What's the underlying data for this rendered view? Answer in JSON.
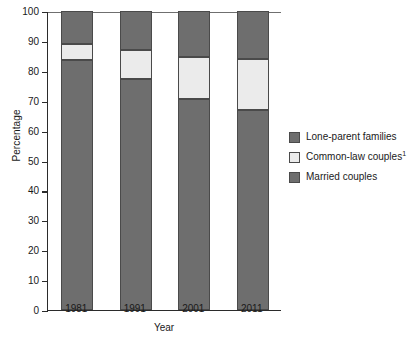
{
  "chart_data": {
    "type": "bar",
    "subtype": "stacked-100-percent",
    "title": "",
    "xlabel": "Year",
    "ylabel": "Percentage",
    "categories": [
      "1981",
      "1991",
      "2001",
      "2011"
    ],
    "ylim": [
      0,
      100
    ],
    "yticks": [
      0,
      10,
      20,
      30,
      40,
      50,
      60,
      70,
      80,
      90,
      100
    ],
    "ytick_labels": [
      "0",
      "10",
      "20",
      "30",
      "40",
      "50",
      "60",
      "70",
      "80",
      "90",
      "100"
    ],
    "grid": false,
    "legend_position": "right",
    "series": [
      {
        "name": "Lone-parent families",
        "color": "#6e6e6e",
        "values": [
          11.0,
          13.0,
          15.5,
          16.0
        ]
      },
      {
        "name": "Common-law couples",
        "footnote": "1",
        "color": "#ebebeb",
        "values": [
          5.5,
          9.8,
          14.0,
          17.0
        ]
      },
      {
        "name": "Married couples",
        "color": "#6e6e6e",
        "values": [
          83.5,
          77.2,
          70.5,
          67.0
        ]
      }
    ],
    "cumulative_tops": {
      "married": [
        83.5,
        77.2,
        70.5,
        67.0
      ],
      "common_law": [
        89.0,
        87.0,
        84.5,
        84.0
      ],
      "lone_parent": [
        100.0,
        100.0,
        100.0,
        100.0
      ]
    }
  },
  "legend": {
    "items": [
      {
        "label": "Lone-parent families",
        "sup": ""
      },
      {
        "label": "Common-law couples",
        "sup": "1"
      },
      {
        "label": "Married couples",
        "sup": ""
      }
    ]
  },
  "axes": {
    "y_title": "Percentage",
    "x_title": "Year"
  }
}
